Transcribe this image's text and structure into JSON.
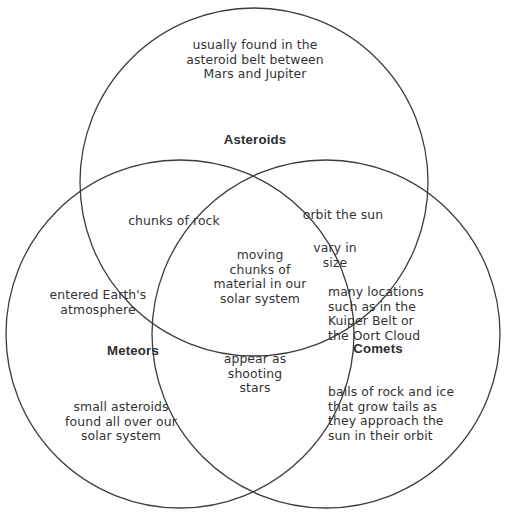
{
  "diagram": {
    "type": "venn",
    "background_color": "#ffffff",
    "stroke_color": "#3d3d3d",
    "text_color": "#333333",
    "artifact_text": "cropped text",
    "sets": [
      {
        "id": "asteroids",
        "label": "Asteroids",
        "position": "top",
        "unique_text": "usually found in the\nasteroid belt between\nMars and Jupiter"
      },
      {
        "id": "meteors",
        "label": "Meteors",
        "position": "bottom-left",
        "unique_text_top": "entered Earth's\natmosphere",
        "unique_text_bottom": "small asteroids\nfound all over our\nsolar system"
      },
      {
        "id": "comets",
        "label": "Comets",
        "position": "bottom-right",
        "unique_text_top": "many locations\nsuch as in the\nKuiper Belt or\nthe Oort Cloud",
        "unique_text_bottom": "balls of rock and ice\nthat grow tails as\nthey approach the\nsun in their orbit"
      }
    ],
    "intersections": [
      {
        "id": "asteroids-meteors",
        "sets": [
          "asteroids",
          "meteors"
        ],
        "text": "chunks of rock"
      },
      {
        "id": "asteroids-comets",
        "sets": [
          "asteroids",
          "comets"
        ],
        "text": "orbit the sun"
      },
      {
        "id": "asteroids-comets-2",
        "sets": [
          "asteroids",
          "comets"
        ],
        "text": "vary in\nsize"
      },
      {
        "id": "meteors-comets",
        "sets": [
          "meteors",
          "comets"
        ],
        "text": "appear as\nshooting\nstars"
      },
      {
        "id": "all-three",
        "sets": [
          "asteroids",
          "meteors",
          "comets"
        ],
        "text": "moving\nchunks of\nmaterial in our\nsolar system"
      }
    ]
  }
}
